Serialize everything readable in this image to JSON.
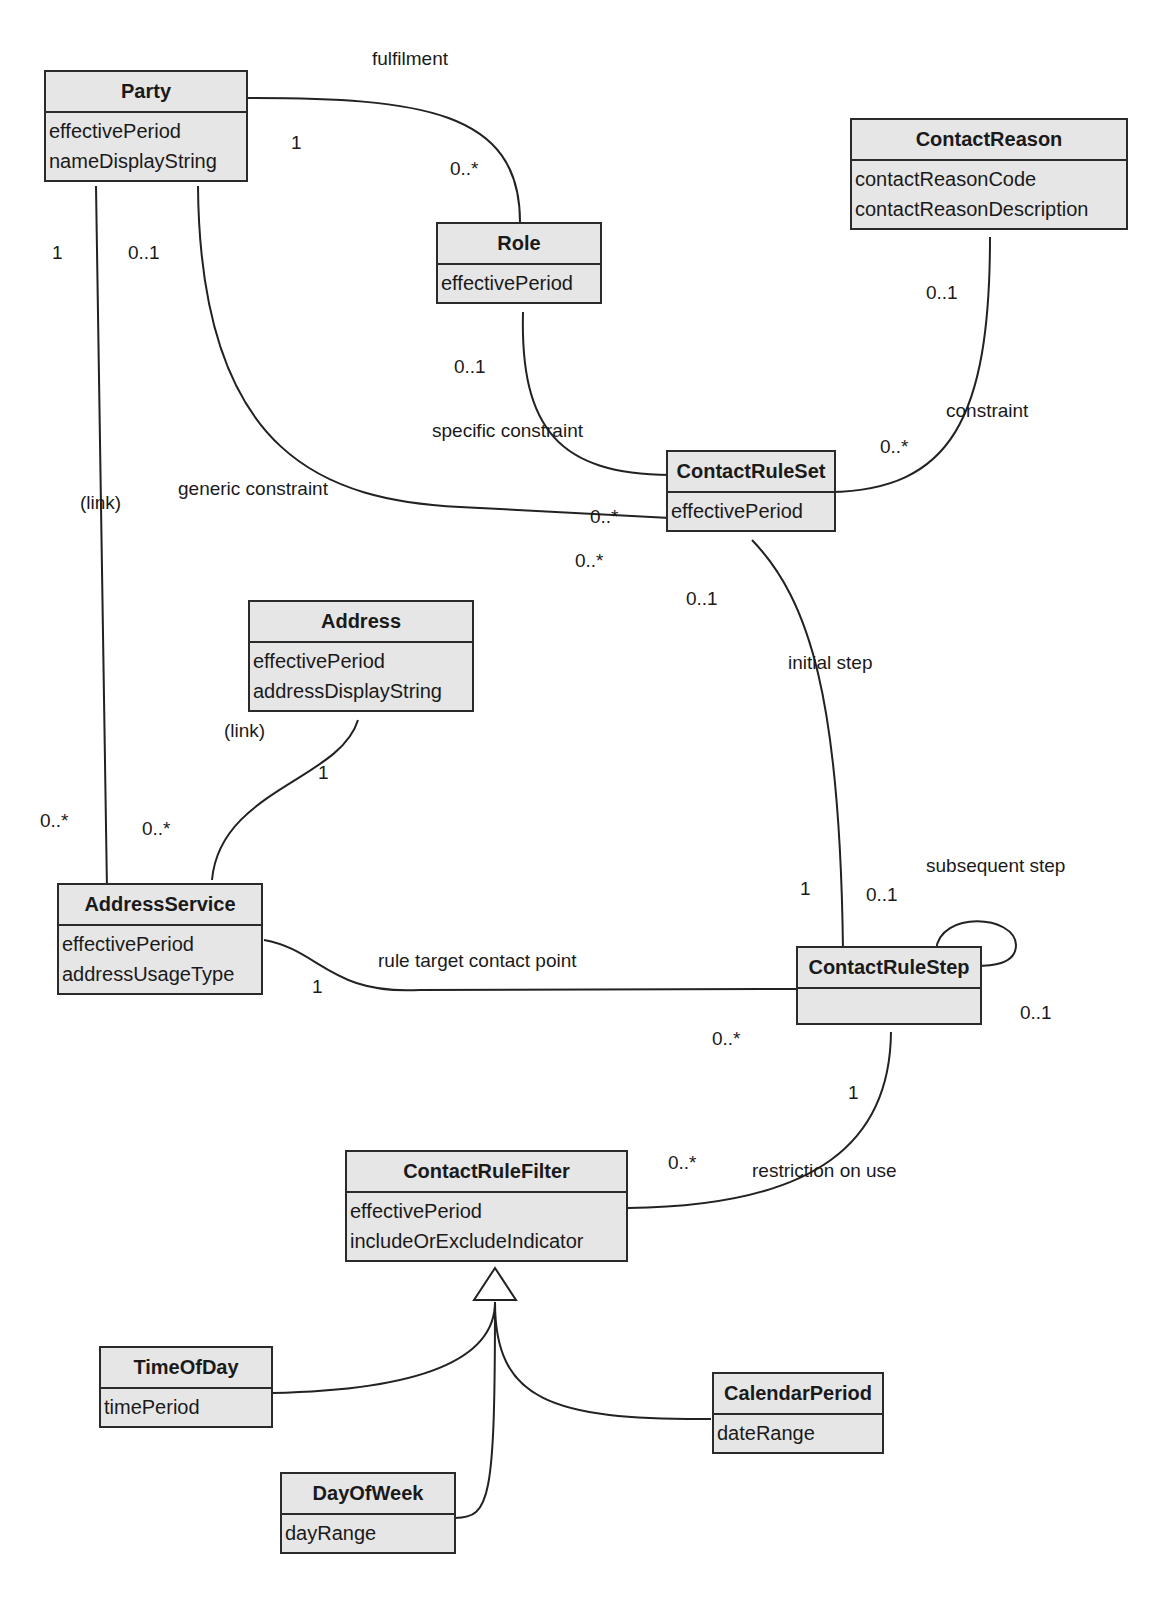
{
  "classes": {
    "party": {
      "name": "Party",
      "attributes": [
        "effectivePeriod",
        "nameDisplayString"
      ]
    },
    "role": {
      "name": "Role",
      "attributes": [
        "effectivePeriod"
      ]
    },
    "contact_reason": {
      "name": "ContactReason",
      "attributes": [
        "contactReasonCode",
        "contactReasonDescription"
      ]
    },
    "contact_rule_set": {
      "name": "ContactRuleSet",
      "attributes": [
        "effectivePeriod"
      ]
    },
    "address": {
      "name": "Address",
      "attributes": [
        "effectivePeriod",
        "addressDisplayString"
      ]
    },
    "address_service": {
      "name": "AddressService",
      "attributes": [
        "effectivePeriod",
        "addressUsageType"
      ]
    },
    "contact_rule_step": {
      "name": "ContactRuleStep",
      "attributes": []
    },
    "contact_rule_filter": {
      "name": "ContactRuleFilter",
      "attributes": [
        "effectivePeriod",
        "includeOrExcludeIndicator"
      ]
    },
    "time_of_day": {
      "name": "TimeOfDay",
      "attributes": [
        "timePeriod"
      ]
    },
    "day_of_week": {
      "name": "DayOfWeek",
      "attributes": [
        "dayRange"
      ]
    },
    "calendar_period": {
      "name": "CalendarPeriod",
      "attributes": [
        "dateRange"
      ]
    }
  },
  "associations": {
    "fulfilment": {
      "label": "fulfilment",
      "from": "Party",
      "to": "Role",
      "from_mult": "1",
      "to_mult": "0..*"
    },
    "party_address_link": {
      "label": "(link)",
      "from": "Party",
      "to": "AddressService",
      "from_mult": "1",
      "to_mult": "0..*"
    },
    "generic_constraint": {
      "label": "generic constraint",
      "from": "Party",
      "to": "ContactRuleSet",
      "from_mult": "0..1",
      "to_mult": "0..*"
    },
    "specific_constraint": {
      "label": "specific constraint",
      "from": "Role",
      "to": "ContactRuleSet",
      "from_mult": "0..1",
      "to_mult": "0..*"
    },
    "constraint": {
      "label": "constraint",
      "from": "ContactReason",
      "to": "ContactRuleSet",
      "from_mult": "0..1",
      "to_mult": "0..*"
    },
    "address_link": {
      "label": "(link)",
      "from": "Address",
      "to": "AddressService",
      "from_mult": "1",
      "to_mult": "0..*"
    },
    "initial_step": {
      "label": "initial step",
      "from": "ContactRuleSet",
      "to": "ContactRuleStep",
      "from_mult": "0..1",
      "to_mult": "1"
    },
    "subsequent_step": {
      "label": "subsequent step",
      "from": "ContactRuleStep",
      "to": "ContactRuleStep",
      "from_mult": "0..1",
      "to_mult": "0..1"
    },
    "rule_target": {
      "label": "rule target contact point",
      "from": "AddressService",
      "to": "ContactRuleStep",
      "from_mult": "1",
      "to_mult": "0..*"
    },
    "restriction_on_use": {
      "label": "restriction on use",
      "from": "ContactRuleStep",
      "to": "ContactRuleFilter",
      "from_mult": "1",
      "to_mult": "0..*"
    }
  },
  "generalization": {
    "parent": "ContactRuleFilter",
    "children": [
      "TimeOfDay",
      "DayOfWeek",
      "CalendarPeriod"
    ]
  }
}
